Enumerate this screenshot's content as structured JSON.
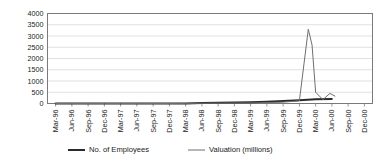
{
  "chart_data": {
    "type": "line",
    "title": "",
    "subtitle": "",
    "xlabel": "",
    "ylabel": "",
    "grid": true,
    "legend_position": "bottom",
    "ylim": [
      0,
      4000
    ],
    "ytick_labels": [
      "0",
      "500",
      "1000",
      "1500",
      "2000",
      "2500",
      "3000",
      "3500",
      "4000"
    ],
    "ytick_values": [
      0,
      500,
      1000,
      1500,
      2000,
      2500,
      3000,
      3500,
      4000
    ],
    "categories": [
      "Mar-96",
      "Jun-96",
      "Sep-96",
      "Dec-96",
      "Mar-97",
      "Jun-97",
      "Sep-97",
      "Dec-97",
      "Mar-98",
      "Jun-98",
      "Sep-98",
      "Dec-98",
      "Mar-99",
      "Jun-99",
      "Sep-99",
      "Dec-99",
      "Mar-00",
      "Jun-00",
      "Sep-00",
      "Dec-00"
    ],
    "series": [
      {
        "name": "No. of Employees",
        "color": "#2b2b2b",
        "width": 2.0,
        "values": [
          0,
          0,
          0,
          0,
          0,
          0,
          0,
          0,
          5,
          20,
          35,
          50,
          60,
          80,
          110,
          150,
          185,
          205,
          null,
          null
        ]
      },
      {
        "name": "Valuation (millions)",
        "color": "#6f6f6f",
        "width": 1.0,
        "values": [
          0,
          0,
          0,
          0,
          0,
          0,
          0,
          0,
          5,
          10,
          15,
          20,
          25,
          40,
          60,
          120,
          2400,
          300,
          null,
          null
        ]
      }
    ],
    "annotations": [
      {
        "label": "valuation-peak",
        "x": "Jan-00",
        "y": 3300
      },
      {
        "label": "valuation-secondary-bump",
        "x": "Jun-00",
        "y": 450
      }
    ]
  },
  "legend": {
    "items": [
      {
        "label": "No. of Employees",
        "color": "#2b2b2b",
        "width": 2.0
      },
      {
        "label": "Valuation (millions)",
        "color": "#6f6f6f",
        "width": 1.0
      }
    ]
  },
  "colors": {
    "background": "#ffffff",
    "plot_border": "#7a7a7a",
    "gridline": "#d8d8d8",
    "axis_text": "#222222",
    "series_employees": "#2b2b2b",
    "series_valuation": "#6f6f6f"
  }
}
